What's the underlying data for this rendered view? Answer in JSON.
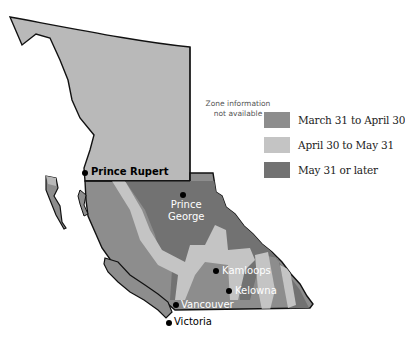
{
  "map": {
    "title": "",
    "note": {
      "line1": "Zone information",
      "line2": "not available"
    },
    "colors": {
      "unknown": "#b9b9b9",
      "march_april": "#8d8d8d",
      "april_may": "#c4c4c4",
      "may_later": "#727272",
      "border": "#111111"
    }
  },
  "legend": {
    "items": [
      {
        "label": "March 31 to April 30",
        "color": "#8d8d8d"
      },
      {
        "label": "April 30 to May 31",
        "color": "#c4c4c4"
      },
      {
        "label": "May 31 or later",
        "color": "#727272"
      }
    ]
  },
  "cities": [
    {
      "name": "Prince Rupert",
      "color": "#000000"
    },
    {
      "name": "Prince",
      "name2": "George",
      "color": "#ffffff"
    },
    {
      "name": "Kamloops",
      "color": "#ffffff"
    },
    {
      "name": "Kelowna",
      "color": "#ffffff"
    },
    {
      "name": "Vancouver",
      "color": "#ffffff"
    },
    {
      "name": "Victoria",
      "color": "#000000"
    }
  ]
}
